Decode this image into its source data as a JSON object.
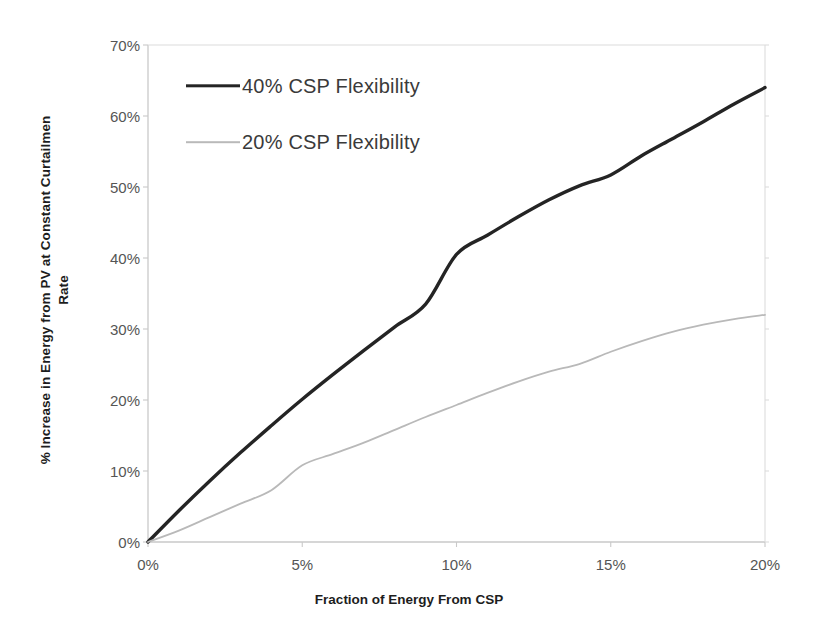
{
  "chart_data": {
    "type": "line",
    "title": "",
    "xlabel": "Fraction of Energy From CSP",
    "ylabel": "% Increase in Energy from PV at Constant Curtailmen",
    "ylabel_line2": "Rate",
    "xlim": [
      0,
      20
    ],
    "ylim": [
      0,
      70
    ],
    "xtick_labels": [
      "0%",
      "5%",
      "10%",
      "15%",
      "20%"
    ],
    "xtick_values": [
      0,
      5,
      10,
      15,
      20
    ],
    "ytick_labels": [
      "0%",
      "10%",
      "20%",
      "30%",
      "40%",
      "50%",
      "60%",
      "70%"
    ],
    "ytick_values": [
      0,
      10,
      20,
      30,
      40,
      50,
      60,
      70
    ],
    "grid": false,
    "legend_position": "upper-left-inside",
    "x": [
      0,
      1,
      2,
      3,
      4,
      5,
      6,
      7,
      8,
      9,
      10,
      11,
      12,
      13,
      14,
      15,
      16,
      17,
      18,
      19,
      20
    ],
    "series": [
      {
        "name": "40% CSP Flexibility",
        "color": "#242424",
        "line_width": 3.4,
        "values": [
          0,
          4.4,
          8.6,
          12.6,
          16.4,
          20.1,
          23.6,
          27.0,
          30.3,
          33.5,
          40.5,
          43.2,
          45.8,
          48.2,
          50.2,
          51.7,
          54.4,
          56.8,
          59.2,
          61.7,
          64.0
        ]
      },
      {
        "name": "20% CSP Flexibility",
        "color": "#b9b9b9",
        "line_width": 1.8,
        "values": [
          0,
          1.6,
          3.5,
          5.4,
          7.3,
          10.8,
          12.4,
          14.0,
          15.8,
          17.6,
          19.3,
          21.0,
          22.6,
          24.0,
          25.1,
          26.8,
          28.3,
          29.6,
          30.6,
          31.4,
          32.0
        ]
      }
    ]
  },
  "legend": {
    "items": [
      {
        "label": "40% CSP Flexibility",
        "swatch": "solid-thick-dark-line"
      },
      {
        "label": "20% CSP Flexibility",
        "swatch": "solid-thin-gray-line"
      }
    ]
  },
  "axis_colors": {
    "axis_line": "#c9c9c9",
    "tick_text": "#555555",
    "label_text": "#1d1d1d"
  }
}
